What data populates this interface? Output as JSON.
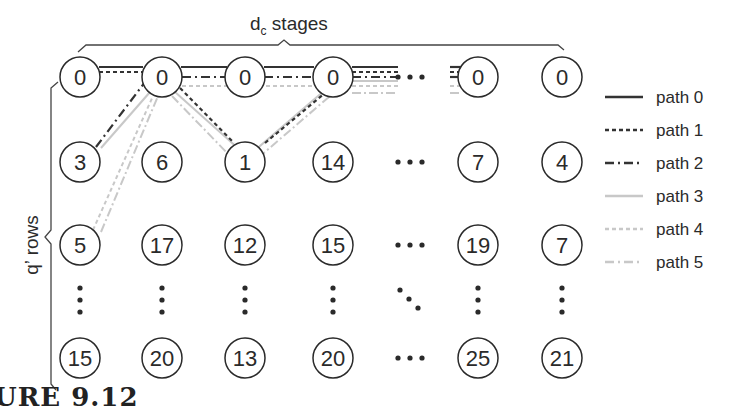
{
  "diagram": {
    "top_label": "d",
    "top_label_sub": "c",
    "top_label_rest": " stages",
    "side_label": "q’ rows",
    "caption": "URE 9.12",
    "colors": {
      "ink": "#2a2a2a",
      "path_dark": "#333333",
      "path_light": "#c8c8c8"
    },
    "columns_x": [
      80,
      162,
      245,
      333,
      410,
      478,
      562
    ],
    "rows_y": [
      77,
      162,
      245,
      300,
      358
    ],
    "nodes": [
      {
        "row": 0,
        "values": [
          "0",
          "0",
          "0",
          "0",
          "…",
          "0",
          "0"
        ]
      },
      {
        "row": 1,
        "values": [
          "3",
          "6",
          "1",
          "14",
          "…",
          "7",
          "4"
        ]
      },
      {
        "row": 2,
        "values": [
          "5",
          "17",
          "12",
          "15",
          "…",
          "19",
          "7"
        ]
      },
      {
        "row": 3,
        "values": [
          "⋮",
          "⋮",
          "⋮",
          "⋮",
          "⋱",
          "⋮",
          "⋮"
        ]
      },
      {
        "row": 4,
        "values": [
          "15",
          "20",
          "13",
          "20",
          "…",
          "25",
          "21"
        ]
      }
    ],
    "legend": [
      {
        "label": "path 0",
        "style": "solid",
        "color": "#333333"
      },
      {
        "label": "path 1",
        "style": "dotted",
        "color": "#333333"
      },
      {
        "label": "path 2",
        "style": "dashdot",
        "color": "#333333"
      },
      {
        "label": "path 3",
        "style": "solid",
        "color": "#c8c8c8"
      },
      {
        "label": "path 4",
        "style": "dotted",
        "color": "#c8c8c8"
      },
      {
        "label": "path 5",
        "style": "dashdot",
        "color": "#c8c8c8"
      }
    ]
  }
}
